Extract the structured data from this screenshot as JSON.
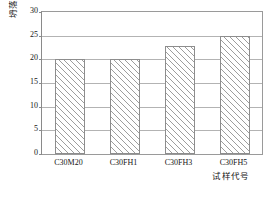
{
  "chart_data": {
    "type": "bar",
    "title": "",
    "xlabel": "试样代号",
    "ylabel": "坍落度 / mm",
    "categories": [
      "C30M20",
      "C30FH1",
      "C30FH3",
      "C30FH5"
    ],
    "values": [
      20.0,
      20.0,
      22.8,
      25.0
    ],
    "ylim": [
      0,
      30
    ],
    "yticks": [
      0,
      5,
      10,
      15,
      20,
      25,
      30
    ],
    "ytick_labels": [
      "0",
      "5",
      "10",
      "15",
      "20",
      "25",
      "30"
    ],
    "grid": true,
    "legend": null,
    "bar_style": {
      "fill": "diagonal-hatch",
      "hatch_color": "#9d9d9d",
      "edge_color": "#8d8d8d",
      "background": "#ffffff"
    },
    "axis_color": "#9a9a9a",
    "gridline_color": "#b3b3b3"
  },
  "figure": {
    "y_axis_title": "坍落度 / mm",
    "x_axis_title": "试样代号",
    "caption_fragment": ""
  }
}
